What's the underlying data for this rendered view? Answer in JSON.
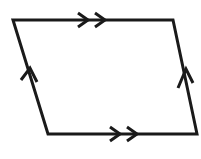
{
  "figure": {
    "shape_name": "parallelogram",
    "background_color": "#ffffff",
    "stroke_color": "#1a1a1a",
    "stroke_width": 3,
    "canvas": {
      "width": 201,
      "height": 159
    },
    "vertices": [
      {
        "label": "top-left",
        "x": 13,
        "y": 20
      },
      {
        "label": "top-right",
        "x": 173,
        "y": 20
      },
      {
        "label": "bottom-right",
        "x": 197,
        "y": 134
      },
      {
        "label": "bottom-left",
        "x": 48,
        "y": 134
      }
    ],
    "outline_path": "M 13 20 L 173 20 L 197 134 L 48 134 Z",
    "edges": [
      {
        "name": "top-edge",
        "from": "top-left",
        "to": "top-right",
        "marker": "double-chevron",
        "marker_count": 2,
        "direction": "right",
        "marker_center": {
          "x": 95,
          "y": 20
        }
      },
      {
        "name": "right-edge",
        "from": "top-right",
        "to": "bottom-right",
        "marker": "single-chevron",
        "marker_count": 1,
        "direction": "up",
        "marker_center": {
          "x": 186,
          "y": 76
        }
      },
      {
        "name": "bottom-edge",
        "from": "bottom-left",
        "to": "bottom-right",
        "marker": "double-chevron",
        "marker_count": 2,
        "direction": "right",
        "marker_center": {
          "x": 125,
          "y": 134
        }
      },
      {
        "name": "left-edge",
        "from": "bottom-left",
        "to": "top-left",
        "marker": "single-chevron",
        "marker_count": 1,
        "direction": "up",
        "marker_center": {
          "x": 30,
          "y": 77
        }
      }
    ],
    "markers": {
      "top_chevron_1": "M 78 13 L 88 20 L 78 27",
      "top_chevron_2": "M 95 13 L 105 20 L 95 27",
      "bottom_chevron_1": "M 110 127 L 120 134 L 110 141",
      "bottom_chevron_2": "M 127 127 L 137 134 L 127 141",
      "left_chevron_1": "M 21 80 L 30 68 L 37 82",
      "right_chevron_1": "M 178 88 L 186 69 L 193 83"
    },
    "labels": {
      "vertex_labels": [],
      "side_labels": [],
      "angle_labels": []
    }
  }
}
